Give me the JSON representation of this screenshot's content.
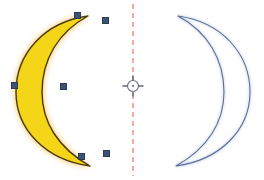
{
  "document": {
    "title": "Mirror transform canvas",
    "background_color": "#ffffff",
    "width": 264,
    "height": 180
  },
  "source_shape": {
    "name": "crescent-moon",
    "state": "selected",
    "fill_color": "#f5d518",
    "glow_color": "#f0a81e",
    "outline_color": "#4a3a10",
    "path": "M 88 16 C 44 22, 16 54, 16 92 C 16 130, 46 160, 90 166 C 58 148, 42 122, 42 92 C 42 60, 58 32, 88 16 Z",
    "glow_path": "M 88 16 C 44 22, 16 54, 16 92 C 16 130, 46 160, 90 166 C 58 148, 42 122, 42 92 C 42 60, 58 32, 88 16 Z"
  },
  "node_handles": {
    "color": "#3d5275",
    "points": [
      {
        "name": "node-top",
        "x": 77,
        "y": 15
      },
      {
        "name": "node-top-right-tip",
        "x": 105,
        "y": 20
      },
      {
        "name": "node-left-middle",
        "x": 14,
        "y": 85
      },
      {
        "name": "node-inner-middle",
        "x": 63,
        "y": 86
      },
      {
        "name": "node-bottom",
        "x": 81,
        "y": 156
      },
      {
        "name": "node-bottom-right-tip",
        "x": 106,
        "y": 153
      }
    ]
  },
  "mirror_axis": {
    "name": "mirror-axis",
    "color": "#e8564a",
    "x": 133,
    "y_start": 4,
    "y_end": 176,
    "dash": "5 4",
    "width": 1
  },
  "center_marker": {
    "name": "transform-origin",
    "x": 133,
    "y": 86,
    "radius": 5.5,
    "arm": 5,
    "color": "#6b6f86",
    "fill": "#ffffff"
  },
  "mirrored_shape": {
    "name": "crescent-moon-mirrored",
    "state": "preview",
    "fill_color": "none",
    "outline_color": "#5a6e9e",
    "stroke_width": 1.1,
    "path": "M 178 16 C 222 22, 250 54, 250 92 C 250 130, 220 160, 176 166 C 208 148, 224 122, 224 92 C 224 60, 208 32, 178 16 Z"
  }
}
